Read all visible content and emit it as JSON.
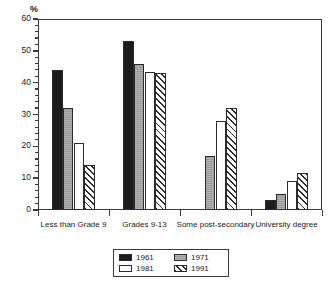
{
  "chart_data": {
    "type": "bar",
    "title": "",
    "subtitle": "",
    "xlabel": "",
    "ylabel": "%",
    "ylim": [
      0,
      60
    ],
    "ytick_step": 10,
    "yminor_step": 2,
    "grid": false,
    "legend_position": "bottom-center",
    "categories": [
      "Less than Grade 9",
      "Grades 9-13",
      "Some post-secondary",
      "University degree"
    ],
    "series": [
      {
        "name": "1961",
        "values": [
          44,
          53,
          0,
          3
        ]
      },
      {
        "name": "1971",
        "values": [
          32,
          46,
          17,
          5
        ]
      },
      {
        "name": "1981",
        "values": [
          21,
          43.5,
          28,
          9
        ]
      },
      {
        "name": "1991",
        "values": [
          14,
          43,
          32,
          11.5
        ]
      }
    ],
    "ytick_labels": [
      "0",
      "10",
      "20",
      "30",
      "40",
      "50",
      "60"
    ],
    "annotations": []
  },
  "legend": {
    "entries": [
      {
        "label": "1961",
        "swatch": "solid-black"
      },
      {
        "label": "1971",
        "swatch": "solid-gray"
      },
      {
        "label": "1981",
        "swatch": "solid-white"
      },
      {
        "label": "1991",
        "swatch": "diagonal-hatch"
      }
    ]
  },
  "axis": {
    "unit_label": "%"
  },
  "colors": {
    "series_1961": "#1c1c1c",
    "series_1971": "#9a9a9a",
    "series_1981": "#ffffff",
    "series_1991": "#ffffff",
    "axis": "#3a3a3a",
    "background": "#ffffff"
  }
}
